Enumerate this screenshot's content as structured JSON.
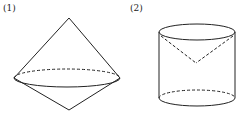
{
  "figures": [
    {
      "label": "(1)",
      "shape": "double cone (two cones joined at base)"
    },
    {
      "label": "(2)",
      "shape": "cylinder with inscribed inverted cone"
    }
  ],
  "colors": {
    "stroke": "#222222",
    "background": "#ffffff"
  }
}
